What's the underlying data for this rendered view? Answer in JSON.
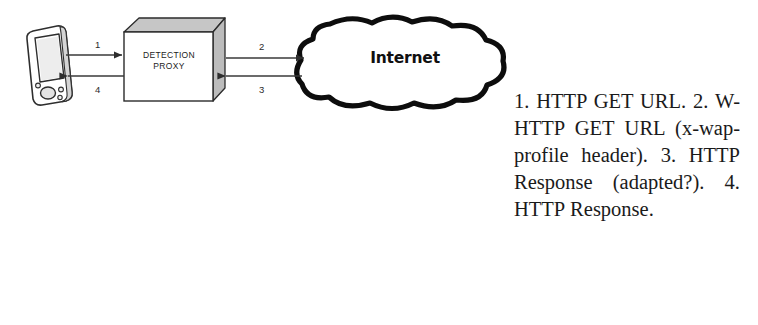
{
  "diagram": {
    "type": "network-flow-diagram",
    "nodes": [
      {
        "id": "client",
        "kind": "pda-device",
        "label": ""
      },
      {
        "id": "proxy",
        "kind": "3d-box",
        "label": "DETECTION\nPROXY"
      },
      {
        "id": "internet",
        "kind": "cloud",
        "label": "Internet"
      }
    ],
    "flows": [
      {
        "number": "1",
        "from": "client",
        "to": "proxy",
        "direction": "right"
      },
      {
        "number": "2",
        "from": "proxy",
        "to": "internet",
        "direction": "right"
      },
      {
        "number": "3",
        "from": "internet",
        "to": "proxy",
        "direction": "left"
      },
      {
        "number": "4",
        "from": "proxy",
        "to": "client",
        "direction": "left"
      }
    ],
    "colors": {
      "line": "#3a3a3a",
      "outline": "#111111",
      "box_face": "#ffffff",
      "box_shade": "#bdbdbd",
      "device_shade": "#d9d9d9",
      "text": "#1a1a1a"
    }
  },
  "caption": {
    "text": "1. HTTP GET URL. 2. W-HTTP GET URL (x-wap-profile header). 3. HTTP Response (adapted?). 4. HTTP Response."
  }
}
